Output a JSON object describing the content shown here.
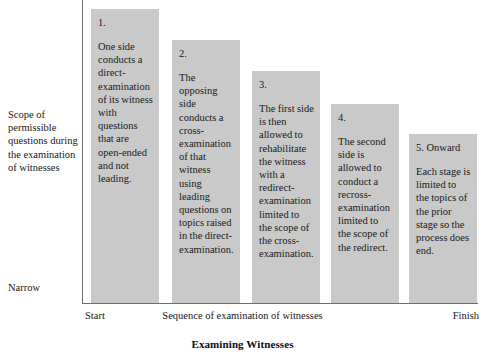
{
  "chart_data": {
    "type": "bar",
    "title": "Examining Witnesses",
    "xlabel": "Sequence of examination of witnesses",
    "ylabel": "Scope of permissible questions during the examination of witnesses",
    "grid": false,
    "legend": "none",
    "x_axis_start_label": "Start",
    "x_axis_end_label": "Finish",
    "y_axis_low_label": "Narrow",
    "y_axis_high_label": "",
    "categories": [
      "1.",
      "2.",
      "3.",
      "4.",
      "5. Onward"
    ],
    "values": [
      100,
      89.5,
      79,
      67.5,
      57.5
    ],
    "ylim": [
      0,
      100
    ],
    "bar_color": "#c9c9c9",
    "axis_color": "#6d6d6d",
    "annotations": [
      "One side conducts a direct-examination of its witness with questions that are open-ended and not leading.",
      "The opposing side conducts a cross-examination of that witness using leading questions on topics raised in the direct-examination.",
      "The first side is then allowed to rehabilitate the witness with a redirect-examination limited to the scope of the cross-examination.",
      "The second side is allowed to conduct a recross-examination limited to the scope of the redirect.",
      "Each stage is limited to the topics of the prior stage so the process does end."
    ]
  },
  "bars": [
    {
      "number": "1.",
      "text": "One side conducts a direct-examination of its witness with questions that are open-ended and not leading."
    },
    {
      "number": "2.",
      "text": "The opposing side conducts a cross-examination of that witness using leading questions on topics raised in the direct-examination."
    },
    {
      "number": "3.",
      "text": "The first side is then allowed to rehabilitate the witness with a redirect-examination limited to the scope of the cross-examination."
    },
    {
      "number": "4.",
      "text": "The second side is allowed to conduct a recross-examination limited to the scope of the redirect."
    },
    {
      "number": "5. Onward",
      "text": "Each stage is limited to the topics of the prior stage so the process does end."
    }
  ],
  "axes": {
    "y_top_label": "Scope of permissible questions during the examination of witnesses",
    "y_bottom_label": "Narrow",
    "x_start_label": "Start",
    "x_center_label": "Sequence of examination of witnesses",
    "x_finish_label": "Finish"
  },
  "title": "Examining Witnesses"
}
